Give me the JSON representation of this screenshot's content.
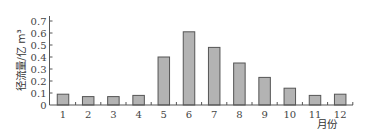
{
  "chart_data": {
    "type": "bar",
    "title": "",
    "xlabel": "月份",
    "ylabel": "径流量/亿 m³",
    "categories": [
      "1",
      "2",
      "3",
      "4",
      "5",
      "6",
      "7",
      "8",
      "9",
      "10",
      "11",
      "12"
    ],
    "values": [
      0.09,
      0.07,
      0.07,
      0.08,
      0.4,
      0.61,
      0.48,
      0.35,
      0.23,
      0.14,
      0.08,
      0.09
    ],
    "yticks": [
      "0",
      "0.1",
      "0.2",
      "0.3",
      "0.4",
      "0.5",
      "0.6",
      "0.7"
    ],
    "ylim": [
      0,
      0.7
    ],
    "grid": false,
    "legend": null,
    "colors": {
      "bar_fill": "#b3b3b3",
      "bar_stroke": "#555555",
      "axis": "#555555"
    }
  }
}
